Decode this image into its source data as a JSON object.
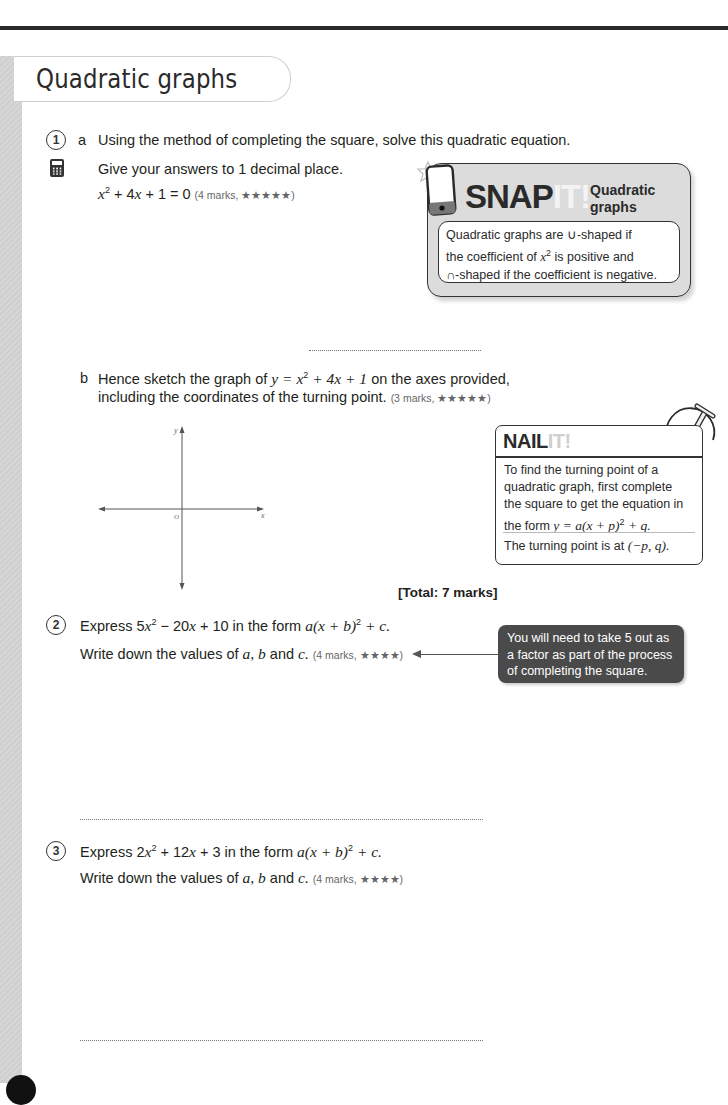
{
  "page": {
    "title": "Quadratic graphs"
  },
  "questions": [
    {
      "number": "1",
      "parts": [
        {
          "label": "a",
          "line1": "Using the method of completing the square, solve this quadratic equation.",
          "line2": "Give your answers to 1 decimal place.",
          "equation_parts": [
            "x",
            "2",
            " + 4",
            "x",
            " + 1 = 0"
          ],
          "marks": "(4 marks, ★★★★★)",
          "icon": "calculator-icon"
        },
        {
          "label": "b",
          "line1_prefix": "Hence sketch the graph of ",
          "line1_math": "y = x",
          "line1_sup": "2",
          "line1_math2": " + 4x + 1",
          "line1_suffix": " on the axes provided,",
          "line2": "including the coordinates of the turning point.",
          "marks": "(3 marks, ★★★★★)",
          "axes": {
            "x_label": "x",
            "y_label": "y",
            "origin_label": "O"
          }
        }
      ],
      "total": "[Total: 7 marks]"
    },
    {
      "number": "2",
      "line1_prefix": "Express 5",
      "line1_x": "x",
      "line1_sup": "2",
      "line1_rest": " − 20",
      "line1_x2": "x",
      "line1_rest2": " + 10 in the form ",
      "line1_form": "a(x + b)",
      "line1_form_sup": "2",
      "line1_form_end": " + c.",
      "line2_prefix": "Write down the values of ",
      "line2_vars": "a, b",
      "line2_and": " and ",
      "line2_c": "c.",
      "marks": "(4 marks, ★★★★)",
      "hint": [
        "You will need to take 5 out as",
        "a factor as part of the process",
        "of completing the square."
      ]
    },
    {
      "number": "3",
      "line1_prefix": "Express 2",
      "line1_x": "x",
      "line1_sup": "2",
      "line1_rest": " + 12",
      "line1_x2": "x",
      "line1_rest2": " + 3 in the form ",
      "line1_form": "a(x + b)",
      "line1_form_sup": "2",
      "line1_form_end": " + c.",
      "line2_prefix": "Write down the values of ",
      "line2_vars": "a, b",
      "line2_and": " and ",
      "line2_c": "c.",
      "marks": "(4 marks, ★★★★)"
    }
  ],
  "snap_it": {
    "word": "SNAP",
    "word_it": "IT!",
    "subtitle_line1": "Quadratic",
    "subtitle_line2": "graphs",
    "text_line1": "Quadratic graphs are ∪-shaped if",
    "text_line2_prefix": "the coefficient of ",
    "text_line2_x": "x",
    "text_line2_sup": "2",
    "text_line2_suffix": " is positive and",
    "text_line3": "∩-shaped if the coefficient is negative."
  },
  "nail_it": {
    "word": "NAIL",
    "word_it": "IT!",
    "lines": [
      "To find the turning point of a",
      "quadratic graph, first complete",
      "the square to get the equation in"
    ],
    "line4_prefix": "the form ",
    "line4_math": "y = a(x + p)",
    "line4_sup": "2",
    "line4_end": " + q.",
    "line5_prefix": "The turning point is at ",
    "line5_math": "(−p, q)."
  },
  "colors": {
    "text": "#231f20",
    "snap_bg": "#dcdcdc",
    "hint_bg": "#4a4a4a",
    "rule": "#2a2a2a"
  }
}
